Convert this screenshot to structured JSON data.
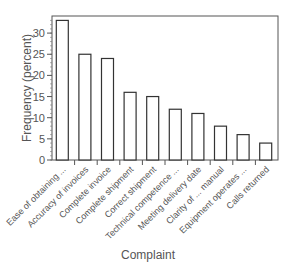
{
  "chart_data": {
    "type": "bar",
    "title": "",
    "xlabel": "Complaint",
    "ylabel": "Frequency (percent)",
    "categories": [
      "Ease of obtaining ...",
      "Accuracy of invoices",
      "Complete invoice",
      "Complete shipment",
      "Correct shipment",
      "Technical competence ...",
      "Meeting delivery date",
      "Clarity of ... manual",
      "Equipment operates ...",
      "Calls returned"
    ],
    "values": [
      33,
      25,
      24,
      16,
      15,
      12,
      11,
      8,
      6,
      4
    ],
    "ylim": [
      0,
      34
    ],
    "yticks": [
      0,
      5,
      10,
      15,
      20,
      25,
      30
    ],
    "grid": false,
    "legend": null,
    "bar_fill": "#ffffff",
    "bar_stroke": "#333333"
  }
}
